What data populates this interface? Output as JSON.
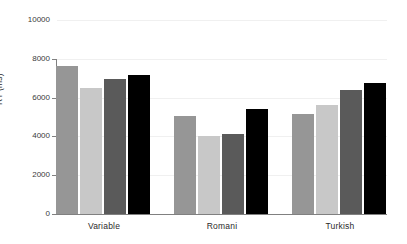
{
  "chart_data": {
    "type": "bar",
    "title": "",
    "subtitle": "",
    "xlabel": "",
    "ylabel": "RT (ms)",
    "categories": [
      "Variable",
      "Romani",
      "Turkish"
    ],
    "series": [
      {
        "name": "Condition 1",
        "color": "#969696",
        "values": [
          7650,
          5050,
          5150
        ]
      },
      {
        "name": "Condition 2",
        "color": "#c8c8c8",
        "values": [
          6500,
          4000,
          5600
        ]
      },
      {
        "name": "Condition 3",
        "color": "#5a5a5a",
        "values": [
          6950,
          4100,
          6400
        ]
      },
      {
        "name": "Condition 4",
        "color": "#000000",
        "values": [
          7150,
          5400,
          6750
        ]
      }
    ],
    "ylim": [
      0,
      10000
    ],
    "yticks": [
      0,
      2000,
      4000,
      6000,
      8000,
      10000
    ],
    "ytick_labels": [
      "0",
      "2000",
      "4000",
      "6000",
      "8000",
      "10000"
    ],
    "grid": true,
    "grid_axis": "y",
    "grid_color": "#f0f0f0",
    "legend": null,
    "legend_position": "none",
    "annotations": [],
    "background_color": "#ffffff",
    "axis_color": "#808080",
    "bar_group_gap": 22,
    "bar_width": 24
  }
}
